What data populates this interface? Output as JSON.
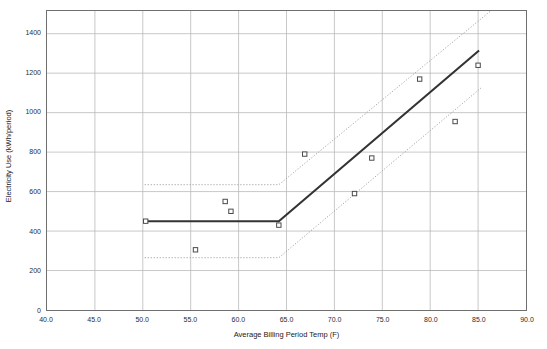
{
  "chart_data": {
    "type": "scatter",
    "title": "",
    "xlabel": "Average Billing Period Temp (F)",
    "ylabel": "Electricity Use (kWh/period)",
    "xlim": [
      40.0,
      90.0
    ],
    "ylim": [
      0,
      1515
    ],
    "xticks": [
      "40.0",
      "45.0",
      "50.0",
      "55.0",
      "60.0",
      "65.0",
      "70.0",
      "75.0",
      "80.0",
      "85.0",
      "90.0"
    ],
    "xtick_values": [
      40.0,
      45.0,
      50.0,
      55.0,
      60.0,
      65.0,
      70.0,
      75.0,
      80.0,
      85.0,
      90.0
    ],
    "yticks": [
      "0",
      "200",
      "400",
      "600",
      "800",
      "1000",
      "1200",
      "1400"
    ],
    "ytick_values": [
      0,
      200,
      400,
      600,
      800,
      1000,
      1200,
      1400
    ],
    "grid": true,
    "legend": "none",
    "series": [
      {
        "name": "Observed billing periods",
        "marker": "open-square",
        "type": "scatter",
        "points": [
          {
            "x": 50.3,
            "y": 450
          },
          {
            "x": 55.5,
            "y": 305
          },
          {
            "x": 58.6,
            "y": 550
          },
          {
            "x": 59.2,
            "y": 500
          },
          {
            "x": 64.2,
            "y": 430
          },
          {
            "x": 66.9,
            "y": 790
          },
          {
            "x": 72.1,
            "y": 590
          },
          {
            "x": 73.9,
            "y": 770
          },
          {
            "x": 78.9,
            "y": 1170
          },
          {
            "x": 82.6,
            "y": 955
          },
          {
            "x": 85.0,
            "y": 1240
          }
        ]
      },
      {
        "name": "Change-point regression fit",
        "type": "line",
        "style": "solid",
        "color": "#333333",
        "breakpoint_x": 64.2,
        "breakpoint_y": 450,
        "points": [
          {
            "x": 50.2,
            "y": 450
          },
          {
            "x": 64.2,
            "y": 450
          },
          {
            "x": 85.1,
            "y": 1315
          }
        ]
      },
      {
        "name": "Upper prediction interval",
        "type": "line",
        "style": "dotted",
        "color": "#9a9a9a",
        "points": [
          {
            "x": 50.2,
            "y": 635
          },
          {
            "x": 64.2,
            "y": 635
          },
          {
            "x": 86.3,
            "y": 1515
          }
        ]
      },
      {
        "name": "Lower prediction interval",
        "type": "line",
        "style": "dotted",
        "color": "#9a9a9a",
        "points": [
          {
            "x": 50.2,
            "y": 265
          },
          {
            "x": 64.2,
            "y": 265
          },
          {
            "x": 85.3,
            "y": 1125
          }
        ]
      }
    ]
  },
  "colors": {
    "frame": "#6f6f6f",
    "grid": "#b9b9b9",
    "fit_line": "#333333",
    "band_line": "#9a9a9a",
    "marker_edge": "#4a4a4a",
    "text": "#2b2b2b",
    "background": "#ffffff"
  }
}
